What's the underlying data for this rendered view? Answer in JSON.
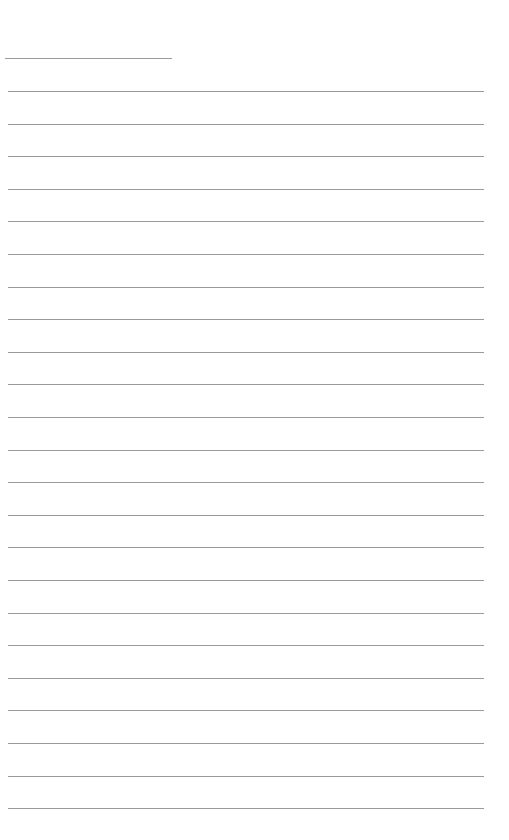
{
  "page": {
    "type": "blank-lined-sheet",
    "background": "#ffffff",
    "line_color": "#9a9a9a",
    "short_line": {
      "top": 58,
      "left": 5,
      "width": 167
    },
    "lines": {
      "count": 23,
      "first_top": 91,
      "spacing": 32.6,
      "left": 8,
      "right": 484
    }
  }
}
